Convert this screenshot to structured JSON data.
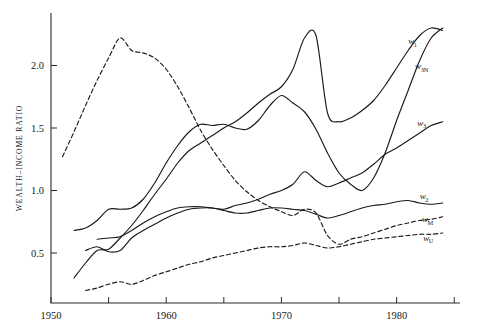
{
  "chart_data": {
    "type": "line",
    "title": "",
    "xlabel": "",
    "ylabel": "WEALTH–INCOME RATIO",
    "xlim": [
      1950,
      1985.5
    ],
    "ylim": [
      0.1,
      2.42
    ],
    "grid": false,
    "legend_position": "right-inline",
    "xticks": [
      1950,
      1955,
      1960,
      1965,
      1970,
      1975,
      1980,
      1985
    ],
    "xticklabels": [
      "1950",
      "",
      "1960",
      "",
      "1970",
      "",
      "1980",
      ""
    ],
    "yticks": [
      0.5,
      1.0,
      1.5,
      2.0
    ],
    "yticklabels": [
      "0.5",
      "1.0",
      "1.5",
      "2.0"
    ],
    "series": [
      {
        "name": "w1",
        "label": "w",
        "sublabel": "1",
        "style": "solid",
        "label_x": 1981.0,
        "label_y": 2.17,
        "x": [
          1952,
          1953,
          1954,
          1955,
          1956,
          1957,
          1958,
          1959,
          1960,
          1961,
          1962,
          1963,
          1964,
          1965,
          1966,
          1967,
          1968,
          1969,
          1970,
          1971,
          1972,
          1973,
          1974,
          1975,
          1976,
          1977,
          1978,
          1979,
          1980,
          1981,
          1982,
          1983,
          1984
        ],
        "y": [
          0.3,
          0.42,
          0.52,
          0.53,
          0.62,
          0.72,
          0.84,
          0.97,
          1.09,
          1.22,
          1.32,
          1.38,
          1.44,
          1.5,
          1.55,
          1.62,
          1.7,
          1.77,
          1.83,
          1.97,
          2.22,
          2.24,
          1.62,
          1.55,
          1.58,
          1.64,
          1.72,
          1.84,
          1.98,
          2.12,
          2.24,
          2.3,
          2.28
        ]
      },
      {
        "name": "w3N",
        "label": "w",
        "sublabel": "3N",
        "style": "solid",
        "label_x": 1981.6,
        "label_y": 1.97,
        "x": [
          1952,
          1953,
          1954,
          1955,
          1956,
          1957,
          1958,
          1959,
          1960,
          1961,
          1962,
          1963,
          1964,
          1965,
          1966,
          1967,
          1968,
          1969,
          1970,
          1971,
          1972,
          1973,
          1974,
          1975,
          1976,
          1977,
          1978,
          1979,
          1980,
          1981,
          1982,
          1983,
          1984
        ],
        "y": [
          0.68,
          0.7,
          0.76,
          0.85,
          0.85,
          0.86,
          0.93,
          1.06,
          1.22,
          1.36,
          1.47,
          1.53,
          1.52,
          1.53,
          1.5,
          1.49,
          1.56,
          1.68,
          1.76,
          1.7,
          1.63,
          1.49,
          1.3,
          1.14,
          1.05,
          1.0,
          1.1,
          1.3,
          1.56,
          1.8,
          2.04,
          2.22,
          2.3
        ]
      },
      {
        "name": "w3",
        "label": "w",
        "sublabel": "3",
        "style": "solid",
        "label_x": 1981.8,
        "label_y": 1.52,
        "x": [
          1954,
          1955,
          1956,
          1957,
          1958,
          1959,
          1960,
          1961,
          1962,
          1963,
          1964,
          1965,
          1966,
          1967,
          1968,
          1969,
          1970,
          1971,
          1972,
          1973,
          1974,
          1975,
          1976,
          1977,
          1978,
          1979,
          1980,
          1981,
          1982,
          1983,
          1984
        ],
        "y": [
          0.61,
          0.62,
          0.63,
          0.68,
          0.74,
          0.79,
          0.83,
          0.86,
          0.87,
          0.87,
          0.86,
          0.85,
          0.88,
          0.9,
          0.93,
          0.97,
          1.0,
          1.05,
          1.15,
          1.08,
          1.03,
          1.06,
          1.1,
          1.14,
          1.21,
          1.29,
          1.34,
          1.4,
          1.46,
          1.52,
          1.55
        ]
      },
      {
        "name": "w2",
        "label": "w",
        "sublabel": "2",
        "style": "solid",
        "label_x": 1982.0,
        "label_y": 0.93,
        "x": [
          1953,
          1954,
          1955,
          1956,
          1957,
          1958,
          1959,
          1960,
          1961,
          1962,
          1963,
          1964,
          1965,
          1966,
          1967,
          1968,
          1969,
          1970,
          1971,
          1972,
          1973,
          1974,
          1975,
          1976,
          1977,
          1978,
          1979,
          1980,
          1981,
          1982,
          1983,
          1984
        ],
        "y": [
          0.52,
          0.55,
          0.51,
          0.52,
          0.62,
          0.68,
          0.73,
          0.78,
          0.82,
          0.85,
          0.86,
          0.86,
          0.84,
          0.82,
          0.82,
          0.84,
          0.86,
          0.86,
          0.85,
          0.84,
          0.81,
          0.78,
          0.8,
          0.83,
          0.86,
          0.88,
          0.89,
          0.91,
          0.92,
          0.9,
          0.89,
          0.9
        ]
      },
      {
        "name": "wM",
        "label": "w",
        "sublabel": "M",
        "style": "dashed",
        "label_x": 1982.2,
        "label_y": 0.75,
        "x": [
          1951,
          1952,
          1953,
          1954,
          1955,
          1956,
          1957,
          1958,
          1959,
          1960,
          1961,
          1962,
          1963,
          1964,
          1965,
          1966,
          1967,
          1968,
          1969,
          1970,
          1971,
          1972,
          1973,
          1974,
          1975,
          1976,
          1977,
          1978,
          1979,
          1980,
          1981,
          1982,
          1983,
          1984
        ],
        "y": [
          1.27,
          1.47,
          1.68,
          1.88,
          2.06,
          2.22,
          2.12,
          2.1,
          2.06,
          1.97,
          1.83,
          1.66,
          1.48,
          1.33,
          1.2,
          1.08,
          0.99,
          0.92,
          0.87,
          0.83,
          0.8,
          0.85,
          0.82,
          0.64,
          0.57,
          0.61,
          0.63,
          0.66,
          0.69,
          0.72,
          0.74,
          0.76,
          0.77,
          0.79
        ]
      },
      {
        "name": "wU",
        "label": "w",
        "sublabel": "U",
        "style": "dashed",
        "label_x": 1982.3,
        "label_y": 0.6,
        "x": [
          1953,
          1954,
          1955,
          1956,
          1957,
          1958,
          1959,
          1960,
          1961,
          1962,
          1963,
          1964,
          1965,
          1966,
          1967,
          1968,
          1969,
          1970,
          1971,
          1972,
          1973,
          1974,
          1975,
          1976,
          1977,
          1978,
          1979,
          1980,
          1981,
          1982,
          1983,
          1984
        ],
        "y": [
          0.2,
          0.22,
          0.25,
          0.27,
          0.25,
          0.28,
          0.32,
          0.35,
          0.38,
          0.41,
          0.43,
          0.46,
          0.48,
          0.5,
          0.52,
          0.54,
          0.55,
          0.55,
          0.56,
          0.58,
          0.56,
          0.54,
          0.55,
          0.57,
          0.59,
          0.61,
          0.62,
          0.63,
          0.64,
          0.65,
          0.65,
          0.66
        ]
      }
    ]
  }
}
